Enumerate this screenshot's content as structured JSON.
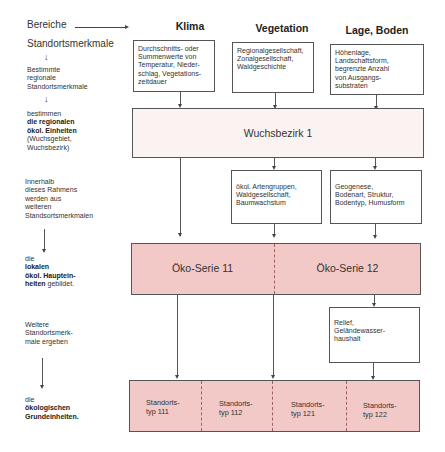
{
  "header": {
    "bereiche_label": "Bereiche",
    "standortsmerkmale_label": "Standortsmerkmale",
    "columns": [
      "Klima",
      "Vegetation",
      "Lage, Boden"
    ]
  },
  "left_labels": {
    "step1": {
      "line1": "Bestimmte",
      "line2": "regionale",
      "line3": "Standortsmerkmale"
    },
    "step2": {
      "line1": "bestimmen",
      "line2_bold": "die regionalen",
      "line3_bold": "ökol. Einheiten",
      "line4": "(Wuchsgebiet,",
      "line5": "Wuchsbezirk)"
    },
    "step3": {
      "line1": "Innerhalb",
      "line2": "dieses Rahmens",
      "line3": "werden aus",
      "line4": "weiteren",
      "line5": "Standsortsmerkmalen"
    },
    "step4": {
      "line1": "die",
      "line2_bold": "lokalen",
      "line3_bold": "ökol. Hauptein-",
      "line4_bold": "heiten",
      "line4_rest": " gebildet."
    },
    "step5": {
      "line1": "Weitere",
      "line2": "Standortsmerk-",
      "line3": "male ergeben"
    },
    "step6": {
      "line1": "die",
      "line2_bold": "ökologischen",
      "line3_bold": "Grundeinheiten."
    }
  },
  "top_boxes": [
    {
      "lines": [
        "Durchschnitts- oder",
        "Summenwerte von",
        "Temperatur, Nieder-",
        "schlag, Vegetations-",
        "zeitdauer"
      ]
    },
    {
      "lines": [
        "Regionalgesellschaft,",
        "Zonalgesellschaft,",
        "Waldgeschichte"
      ]
    },
    {
      "lines": [
        "Höhenlage,",
        "Landschaftsform,",
        "begrenzte Anzahl",
        "von Ausgangs-",
        "substraten"
      ]
    }
  ],
  "wuchsbezirk": {
    "label": "Wuchsbezirk 1"
  },
  "middle_boxes": [
    {
      "lines": [
        "ökol. Artengruppen,",
        "Waldgesellschaft,",
        "Baumwachstum"
      ]
    },
    {
      "lines": [
        "Geogenese,",
        "Bodenart, Struktur,",
        "Bodentyp, Humusform"
      ]
    }
  ],
  "oeko_series": [
    {
      "label": "Öko-Serie 11"
    },
    {
      "label": "Öko-Serie 12"
    }
  ],
  "relief_box": {
    "lines": [
      "Relief,",
      "Geländewasser-",
      "haushalt"
    ]
  },
  "standortstypen": [
    {
      "line1": "Standorts-",
      "line2": "typ 111"
    },
    {
      "line1": "Standorts-",
      "line2": "typ 112"
    },
    {
      "line1": "Standorts-",
      "line2": "typ 121"
    },
    {
      "line1": "Standorts-",
      "line2": "typ 122"
    }
  ],
  "colors": {
    "band_grey": "#fbf3f1",
    "band_pink": "#f2c9c6",
    "line": "#555555"
  }
}
